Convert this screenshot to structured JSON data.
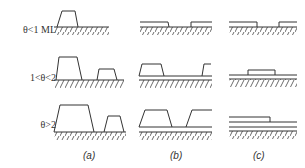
{
  "figure": {
    "rows": [
      {
        "id": "row1",
        "label": "θ<1 ML"
      },
      {
        "id": "row2",
        "label": "1<θ<2"
      },
      {
        "id": "row3",
        "label": "θ>2"
      }
    ],
    "columns": [
      {
        "id": "a",
        "label": "(a)",
        "mode": "Island growth (Volmer-Weber)"
      },
      {
        "id": "b",
        "label": "(b)",
        "mode": "Layer-plus-island growth (Stranski-Krastanov)"
      },
      {
        "id": "c",
        "label": "(c)",
        "mode": "Layer-by-layer growth (Frank-van der Merwe)"
      }
    ],
    "colors": {
      "line": "#333333",
      "background": "#ffffff"
    }
  }
}
